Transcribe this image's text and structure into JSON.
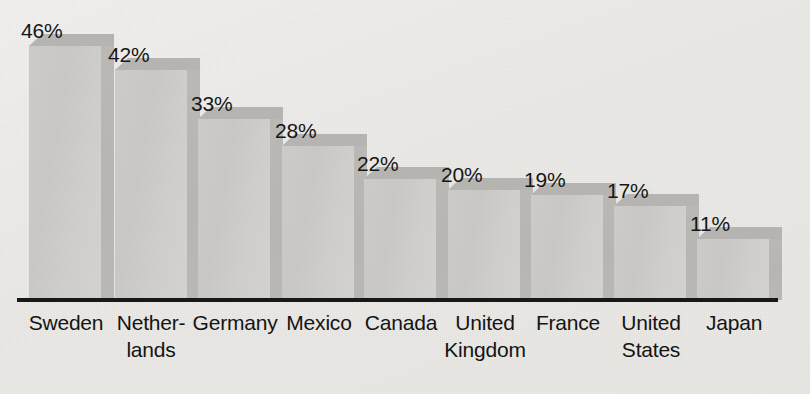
{
  "chart_data": {
    "type": "bar",
    "title": "",
    "subtitle": "",
    "xlabel": "",
    "ylabel": "",
    "categories": [
      "Sweden",
      "Nether-\nlands",
      "Germany",
      "Mexico",
      "Canada",
      "United\nKingdom",
      "France",
      "United\nStates",
      "Japan"
    ],
    "values": [
      46,
      42,
      33,
      28,
      22,
      20,
      19,
      17,
      11
    ],
    "value_labels": [
      "46%",
      "42%",
      "33%",
      "28%",
      "22%",
      "20%",
      "19%",
      "17%",
      "11%"
    ],
    "value_unit": "%",
    "ylim": [
      0,
      46
    ],
    "grid": false,
    "legend": null,
    "style": "3d-bars-grayscale",
    "axis_line": "horizontal-baseline-only",
    "tick_labels_y": []
  },
  "colors": {
    "background": "#eeedeb",
    "bar_front": "#cbcac7",
    "bar_side": "#b8b7b3",
    "bar_top": "#b5b4b0",
    "axis": "#17181a",
    "text": "#141414"
  },
  "bars": [
    {
      "label": "Sweden",
      "value": 46,
      "value_label": "46%",
      "left": 29,
      "width": 72,
      "top": 45,
      "label_left": 21,
      "label_top": 19,
      "tick_center": 66
    },
    {
      "label": "Nether- lands",
      "value": 42,
      "value_label": "42%",
      "left": 115,
      "width": 72,
      "top": 69,
      "label_left": 108,
      "label_top": 43,
      "tick_center": 152
    },
    {
      "label": "Germany",
      "value": 33,
      "value_label": "33%",
      "left": 198,
      "width": 72,
      "top": 118,
      "label_left": 191,
      "label_top": 92,
      "tick_center": 235
    },
    {
      "label": "Mexico",
      "value": 28,
      "value_label": "28%",
      "left": 282,
      "width": 72,
      "top": 145,
      "label_left": 275,
      "label_top": 119,
      "tick_center": 319
    },
    {
      "label": "Canada",
      "value": 22,
      "value_label": "22%",
      "left": 364,
      "width": 72,
      "top": 178,
      "label_left": 357,
      "label_top": 152,
      "tick_center": 401
    },
    {
      "label": "United Kingdom",
      "value": 20,
      "value_label": "20%",
      "left": 448,
      "width": 72,
      "top": 189,
      "label_left": 441,
      "label_top": 163,
      "tick_center": 485
    },
    {
      "label": "France",
      "value": 19,
      "value_label": "19%",
      "left": 531,
      "width": 72,
      "top": 194,
      "label_left": 524,
      "label_top": 168,
      "tick_center": 568
    },
    {
      "label": "United States",
      "value": 17,
      "value_label": "17%",
      "left": 614,
      "width": 72,
      "top": 205,
      "label_left": 607,
      "label_top": 179,
      "tick_center": 651
    },
    {
      "label": "Japan",
      "value": 11,
      "value_label": "11%",
      "left": 697,
      "width": 72,
      "top": 238,
      "label_left": 690,
      "label_top": 212,
      "tick_center": 734
    }
  ],
  "x_axis_labels": [
    {
      "text": "Sweden",
      "left": 11,
      "width": 110
    },
    {
      "text": "Netherlands",
      "left": 96,
      "width": 110,
      "display": "Nether-\nlands"
    },
    {
      "text": "Germany",
      "left": 180,
      "width": 110
    },
    {
      "text": "Mexico",
      "left": 264,
      "width": 110
    },
    {
      "text": "Canada",
      "left": 346,
      "width": 110
    },
    {
      "text": "United Kingdom",
      "left": 430,
      "width": 110,
      "display": "United\nKingdom"
    },
    {
      "text": "France",
      "left": 513,
      "width": 110
    },
    {
      "text": "United States",
      "left": 596,
      "width": 110,
      "display": "United\nStates"
    },
    {
      "text": "Japan",
      "left": 679,
      "width": 110
    }
  ]
}
